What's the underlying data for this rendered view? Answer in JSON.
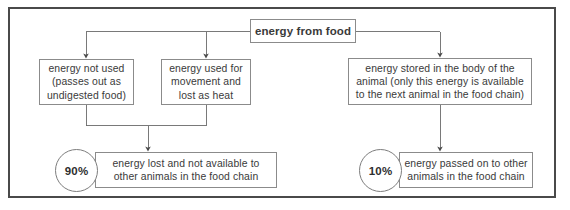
{
  "diagram": {
    "title_node": {
      "id": "energy-from-food",
      "label": "energy from food"
    },
    "branches": [
      {
        "id": "energy-not-used",
        "label": "energy not used\n(passes out as\nundigested food)"
      },
      {
        "id": "energy-used-movement-heat",
        "label": "energy used for\nmovement and\nlost as heat"
      },
      {
        "id": "energy-stored-in-body",
        "label": "energy stored in the body of the\nanimal (only this energy is available\nto the next animal in the food chain)"
      }
    ],
    "outcomes": [
      {
        "id": "energy-lost",
        "percent": "90%",
        "label": "energy lost and not available to\nother animals in the food chain"
      },
      {
        "id": "energy-passed-on",
        "percent": "10%",
        "label": "energy passed on to other\nanimals in the food chain"
      }
    ],
    "colors": {
      "frame_border": "#4a4a4a",
      "node_border": "#8b8b8b",
      "connector": "#5a5a5a",
      "text": "#3a3a3a",
      "background": "#ffffff"
    }
  }
}
